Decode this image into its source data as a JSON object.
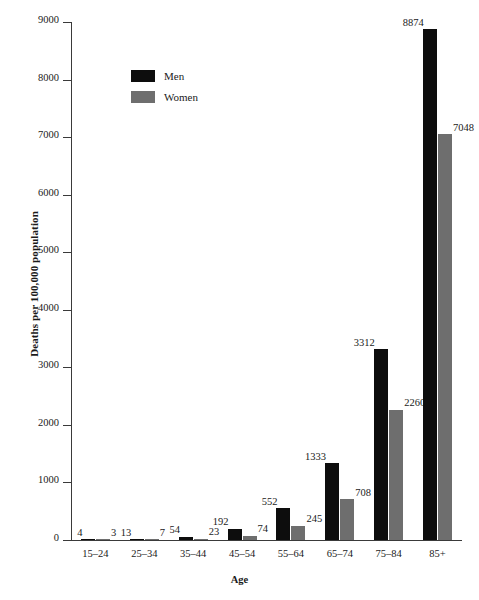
{
  "chart_data": {
    "type": "bar",
    "title": "",
    "xlabel": "Age",
    "ylabel": "Deaths per 100,000 population",
    "categories": [
      "15–24",
      "25–34",
      "35–44",
      "45–54",
      "55–64",
      "65–74",
      "75–84",
      "85+"
    ],
    "series": [
      {
        "name": "Men",
        "color": "#0d0d0d",
        "values": [
          4,
          13,
          54,
          192,
          552,
          1333,
          3312,
          8874
        ]
      },
      {
        "name": "Women",
        "color": "#6e6e6e",
        "values": [
          3,
          7,
          23,
          74,
          245,
          708,
          2260,
          7048
        ]
      }
    ],
    "ylim": [
      0,
      9000
    ],
    "yticks": [
      0,
      1000,
      2000,
      3000,
      4000,
      5000,
      6000,
      7000,
      8000,
      9000
    ],
    "ytick_labels": [
      "0",
      "1000",
      "2000",
      "3000",
      "4000",
      "5000",
      "6000",
      "7000",
      "8000",
      "9000"
    ],
    "grid": false,
    "legend_position": "upper-left-inside",
    "value_labels_shown": true
  },
  "legend": {
    "entries": [
      {
        "label": "Men",
        "swatch": "men"
      },
      {
        "label": "Women",
        "swatch": "women"
      }
    ]
  }
}
